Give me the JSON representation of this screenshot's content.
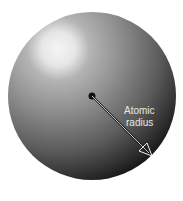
{
  "diagram": {
    "label_line1": "Atomic",
    "label_line2": "radius",
    "colors": {
      "background": "#ffffff",
      "sphere_highlight": "#f2f2f2",
      "sphere_mid": "#8a8a8a",
      "sphere_dark": "#1a1a1a",
      "label": "#e8e8e8",
      "nucleus": "#111111"
    }
  }
}
